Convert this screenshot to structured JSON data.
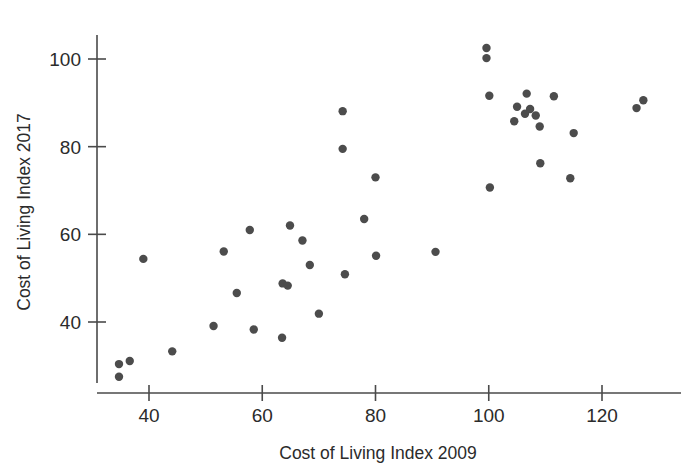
{
  "chart_data": {
    "type": "scatter",
    "title": "",
    "xlabel": "Cost of Living Index 2009",
    "ylabel": "Cost of Living Index 2017",
    "xlim": [
      33,
      130
    ],
    "ylim": [
      26,
      104
    ],
    "xticks": [
      40,
      60,
      80,
      100,
      120
    ],
    "yticks": [
      40,
      60,
      80,
      100
    ],
    "xtick_labels": [
      "40",
      "60",
      "80",
      "100",
      "120"
    ],
    "ytick_labels": [
      "40",
      "60",
      "80",
      "100"
    ],
    "grid": false,
    "legend": null,
    "marker": {
      "shape": "circle",
      "color": "#4c4c4c",
      "radius_px": 4.2
    },
    "points": [
      {
        "x": 34.7,
        "y": 30.4
      },
      {
        "x": 34.7,
        "y": 27.5
      },
      {
        "x": 36.6,
        "y": 31.1
      },
      {
        "x": 39.0,
        "y": 54.4
      },
      {
        "x": 44.1,
        "y": 33.3
      },
      {
        "x": 51.4,
        "y": 39.1
      },
      {
        "x": 53.2,
        "y": 56.1
      },
      {
        "x": 55.5,
        "y": 46.6
      },
      {
        "x": 57.8,
        "y": 61.0
      },
      {
        "x": 58.5,
        "y": 38.3
      },
      {
        "x": 63.5,
        "y": 36.4
      },
      {
        "x": 63.6,
        "y": 48.8
      },
      {
        "x": 64.5,
        "y": 48.3
      },
      {
        "x": 64.9,
        "y": 62.0
      },
      {
        "x": 67.1,
        "y": 58.6
      },
      {
        "x": 68.4,
        "y": 53.0
      },
      {
        "x": 70.0,
        "y": 41.9
      },
      {
        "x": 74.2,
        "y": 88.1
      },
      {
        "x": 74.2,
        "y": 79.5
      },
      {
        "x": 74.6,
        "y": 50.9
      },
      {
        "x": 78.0,
        "y": 63.5
      },
      {
        "x": 80.0,
        "y": 73.0
      },
      {
        "x": 80.1,
        "y": 55.1
      },
      {
        "x": 90.6,
        "y": 56.0
      },
      {
        "x": 99.6,
        "y": 102.5
      },
      {
        "x": 99.6,
        "y": 100.2
      },
      {
        "x": 100.1,
        "y": 91.6
      },
      {
        "x": 100.2,
        "y": 70.7
      },
      {
        "x": 104.5,
        "y": 85.8
      },
      {
        "x": 105.0,
        "y": 89.1
      },
      {
        "x": 106.4,
        "y": 87.5
      },
      {
        "x": 106.7,
        "y": 92.1
      },
      {
        "x": 107.3,
        "y": 88.6
      },
      {
        "x": 108.3,
        "y": 87.1
      },
      {
        "x": 109.0,
        "y": 84.6
      },
      {
        "x": 109.1,
        "y": 76.2
      },
      {
        "x": 111.5,
        "y": 91.5
      },
      {
        "x": 114.4,
        "y": 72.8
      },
      {
        "x": 115.0,
        "y": 83.1
      },
      {
        "x": 126.1,
        "y": 88.8
      },
      {
        "x": 127.3,
        "y": 90.6
      }
    ]
  },
  "axes": {
    "x_axis_label": "Cost of Living Index 2009",
    "y_axis_label": "Cost of Living Index 2017"
  }
}
